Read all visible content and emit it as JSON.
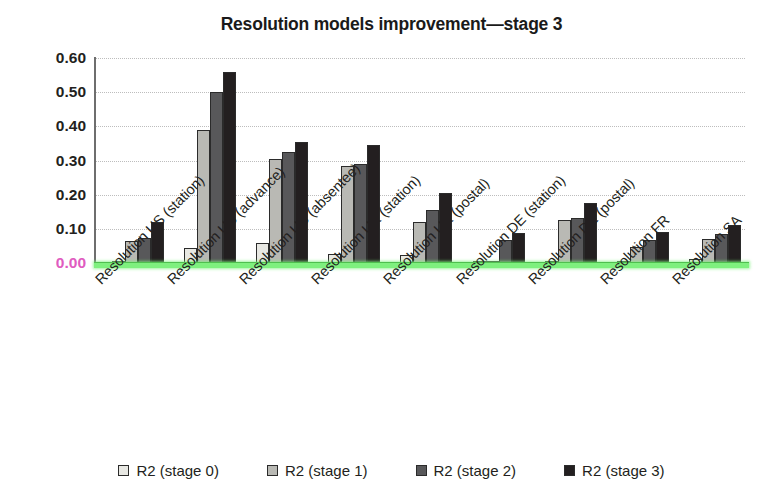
{
  "chart_data": {
    "type": "bar",
    "title": "Resolution models improvement—stage 3",
    "xlabel": "",
    "ylabel": "",
    "ylim": [
      0.0,
      0.6
    ],
    "yticks": [
      "0.00",
      "0.10",
      "0.20",
      "0.30",
      "0.40",
      "0.50",
      "0.60"
    ],
    "ytick_values": [
      0.0,
      0.1,
      0.2,
      0.3,
      0.4,
      0.5,
      0.6
    ],
    "grid": true,
    "legend_position": "bottom",
    "categories": [
      "Resolution US (station)",
      "Resolution US (advance)",
      "Resolution US (absentee)",
      "Resolution UK (station)",
      "Resolution UK (postal)",
      "Resolution DE (station)",
      "Resolution DE (postal)",
      "Resolution FR",
      "Resolution SA"
    ],
    "series": [
      {
        "name": "R2 (stage 0)",
        "color": "#e8e8e3",
        "values": [
          0.005,
          0.045,
          0.06,
          0.025,
          0.022,
          0.002,
          0.004,
          0.002,
          0.012
        ]
      },
      {
        "name": "R2 (stage 1)",
        "color": "#b9b9b4",
        "values": [
          0.065,
          0.39,
          0.305,
          0.285,
          0.12,
          0.002,
          0.125,
          0.048,
          0.07
        ]
      },
      {
        "name": "R2 (stage 2)",
        "color": "#58585a",
        "values": [
          0.072,
          0.5,
          0.325,
          0.29,
          0.155,
          0.068,
          0.133,
          0.068,
          0.085
        ]
      },
      {
        "name": "R2 (stage 3)",
        "color": "#231f20",
        "values": [
          0.12,
          0.56,
          0.355,
          0.345,
          0.205,
          0.088,
          0.175,
          0.092,
          0.112
        ]
      }
    ],
    "axis_colors": {
      "x_axis_line": "#7ef07e",
      "zero_label": "#e05bc0",
      "gridline": "#bdbdbd"
    }
  }
}
